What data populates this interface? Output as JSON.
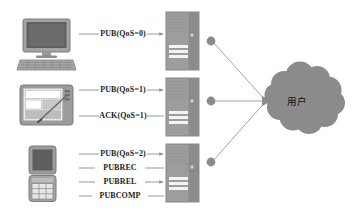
{
  "diagram": {
    "background_color": "#ffffff",
    "palette": {
      "device_fill": "#9a9a9a",
      "device_dark": "#6f6f6f",
      "device_screen": "#8d8d8d",
      "server_fill": "#9d9d9d",
      "server_edge": "#808080",
      "server_slot": "#f2f2f2",
      "node_fill": "#8a8a8a",
      "cloud_fill": "#8b8b8b",
      "line_color": "#8d8d8d",
      "text_color": "#1d1d1d"
    }
  },
  "clients": [
    {
      "name": "desktop-computer",
      "icon": "desktop-computer-icon",
      "row": 0
    },
    {
      "name": "tablet-device",
      "icon": "tablet-device-icon",
      "row": 1
    },
    {
      "name": "mobile-phone",
      "icon": "mobile-phone-icon",
      "row": 2
    }
  ],
  "brokers": [
    {
      "name": "broker-server-qos0",
      "icon": "server-tower-icon",
      "row": 0
    },
    {
      "name": "broker-server-qos1",
      "icon": "server-tower-icon",
      "row": 1
    },
    {
      "name": "broker-server-qos2",
      "icon": "server-tower-icon",
      "row": 2
    }
  ],
  "flows": {
    "qos0": [
      {
        "label": "PUB(QoS=0)",
        "direction": "right",
        "arrow": true
      }
    ],
    "qos1": [
      {
        "label": "PUB(QoS=1)",
        "direction": "right",
        "arrow": true
      },
      {
        "label": "ACK(QoS=1)",
        "direction": "left",
        "arrow": false
      }
    ],
    "qos2": [
      {
        "label": "PUB(QoS=2)",
        "direction": "right",
        "arrow": true
      },
      {
        "label": "PUBREC",
        "direction": "left",
        "arrow": false
      },
      {
        "label": "PUBREL",
        "direction": "right",
        "arrow": true
      },
      {
        "label": "PUBCOMP",
        "direction": "left",
        "arrow": false
      }
    ]
  },
  "labels": {
    "pub_qos0": "PUB(QoS=0)",
    "pub_qos1": "PUB(QoS=1)",
    "ack_qos1": "ACK(QoS=1)",
    "pub_qos2": "PUB(QoS=2)",
    "pubrec": "PUBREC",
    "pubrel": "PUBREL",
    "pubcomp": "PUBCOMP"
  },
  "cloud": {
    "name": "user-cloud",
    "label": "用户"
  },
  "nodes": [
    {
      "name": "connection-node-top"
    },
    {
      "name": "connection-node-middle"
    },
    {
      "name": "connection-node-bottom"
    }
  ]
}
